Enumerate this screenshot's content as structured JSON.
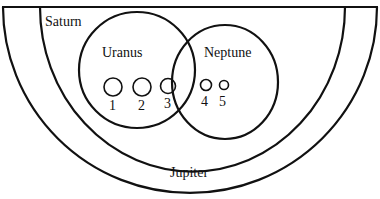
{
  "diagram": {
    "type": "nested-set-diagram",
    "regions": {
      "outer": {
        "label": "Jupiter"
      },
      "middle": {
        "label": "Saturn"
      },
      "left_circle": {
        "label": "Uranus"
      },
      "right_circle": {
        "label": "Neptune"
      }
    },
    "items": [
      {
        "label": "1",
        "region": "Uranus"
      },
      {
        "label": "2",
        "region": "Uranus"
      },
      {
        "label": "3",
        "region": "Uranus"
      },
      {
        "label": "4",
        "region": "Neptune"
      },
      {
        "label": "5",
        "region": "Neptune"
      }
    ],
    "colors": {
      "line": "#111111",
      "background": "#ffffff"
    }
  }
}
